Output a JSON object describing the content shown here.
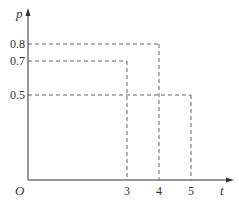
{
  "chart_data": {
    "type": "line",
    "title": "",
    "xlabel": "t",
    "ylabel": "p",
    "origin_label": "O",
    "xlim": [
      0,
      6
    ],
    "ylim": [
      0,
      1
    ],
    "grid": false,
    "x_ticks": [
      {
        "value": 3,
        "label": "3"
      },
      {
        "value": 4,
        "label": "4"
      },
      {
        "value": 5,
        "label": "5"
      }
    ],
    "y_ticks": [
      {
        "value": 0.8,
        "label": "0.8"
      },
      {
        "value": 0.7,
        "label": "0.7"
      },
      {
        "value": 0.5,
        "label": "0.5"
      }
    ],
    "reference_lines": [
      {
        "name": "guide-0.7-to-3",
        "y": 0.7,
        "x": 3
      },
      {
        "name": "guide-0.8-to-4",
        "y": 0.8,
        "x": 4
      },
      {
        "name": "guide-0.5-to-5",
        "y": 0.5,
        "x": 5
      }
    ]
  }
}
